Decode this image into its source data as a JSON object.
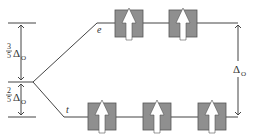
{
  "diagram": {
    "type": "crystal-field-splitting",
    "levels": {
      "upper": {
        "label": "e",
        "orbital_count": 2,
        "electrons": [
          "up",
          "up"
        ]
      },
      "lower": {
        "label": "t",
        "orbital_count": 3,
        "electrons": [
          "up",
          "up",
          "up"
        ]
      }
    },
    "left_annotations": {
      "upper_fraction_num": "3",
      "upper_fraction_den": "5",
      "upper_symbol": "Δ",
      "upper_subscript": "O",
      "lower_fraction_num": "2",
      "lower_fraction_den": "5",
      "lower_symbol": "Δ",
      "lower_subscript": "O"
    },
    "right_annotation": {
      "symbol": "Δ",
      "subscript": "O"
    },
    "colors": {
      "box_fill": "#8f8f8f",
      "box_stroke": "#555555",
      "arrow_fill": "#ffffff",
      "line": "#444444",
      "text": "#333333"
    }
  }
}
